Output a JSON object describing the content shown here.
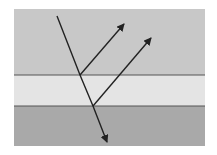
{
  "diagram": {
    "type": "thin-film-reflection",
    "layers": [
      {
        "name": "top-medium",
        "color": "#c8c8c8"
      },
      {
        "name": "thin-film",
        "color": "#e4e4e4"
      },
      {
        "name": "bottom-medium",
        "color": "#a9a9a9"
      }
    ],
    "interface_color": "#555555",
    "ray_color": "#222222",
    "rays": [
      {
        "name": "incident-ray"
      },
      {
        "name": "reflected-ray-1"
      },
      {
        "name": "reflected-ray-2"
      },
      {
        "name": "transmitted-ray"
      }
    ]
  }
}
